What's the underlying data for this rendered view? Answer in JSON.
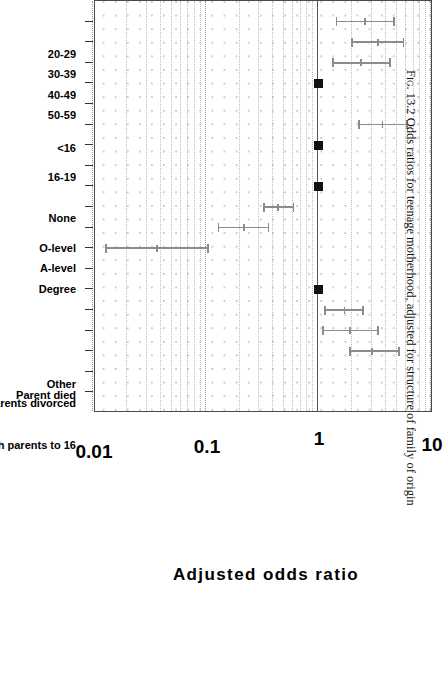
{
  "figure": {
    "caption_number": "Fig. 13.2",
    "caption_text": "Odds ratios for teenage motherhood, adjusted for structure of family of origin",
    "bleed_text": "scale adjusted for structure of family"
  },
  "axis": {
    "title": "Adjusted odds ratio",
    "ticks": [
      "0.01",
      "0.1",
      "1",
      "10"
    ],
    "min": 0.01,
    "max": 10
  },
  "groups": [
    {
      "name": "Age at interview",
      "label_lines": [
        "Age at",
        "interview"
      ]
    },
    {
      "name": "Age at first intercourse",
      "label_lines": [
        "Age at first",
        "intercourse"
      ]
    },
    {
      "name": "Education",
      "label_lines": [
        "Education"
      ]
    },
    {
      "name": "Family structure",
      "label_lines": [
        "Family",
        "structure"
      ]
    }
  ],
  "chart_data": {
    "type": "scatter",
    "title": "Odds ratios for teenage motherhood, adjusted for structure of family of origin",
    "xlabel": "",
    "ylabel": "Adjusted odds ratio",
    "orientation": "horizontal-forest-plot",
    "scale": "log10",
    "ylim": [
      0.01,
      10
    ],
    "grid": true,
    "reference_line": 1,
    "categories": [
      "20-29",
      "30-39",
      "40-49",
      "50-59",
      "<16",
      "16-19",
      "None",
      "O-level",
      "A-level",
      "Degree",
      "Lived with both parents to 16",
      "Parents divorced",
      "Parent died",
      "Other"
    ],
    "points": [
      {
        "category": "20-29",
        "group": "Age at interview",
        "odds_ratio": 2.6,
        "ci_low": 1.45,
        "ci_high": 4.7,
        "reference": false
      },
      {
        "category": "30-39",
        "group": "Age at interview",
        "odds_ratio": 3.4,
        "ci_low": 2.0,
        "ci_high": 5.7,
        "reference": false
      },
      {
        "category": "40-49",
        "group": "Age at interview",
        "odds_ratio": 2.4,
        "ci_low": 1.35,
        "ci_high": 4.3,
        "reference": false
      },
      {
        "category": "50-59",
        "group": "Age at interview",
        "odds_ratio": 1.0,
        "ci_low": 1.0,
        "ci_high": 1.0,
        "reference": true
      },
      {
        "category": "<16",
        "group": "Age at first intercourse",
        "odds_ratio": 3.7,
        "ci_low": 2.3,
        "ci_high": 6.1,
        "reference": false
      },
      {
        "category": "16-19",
        "group": "Age at first intercourse",
        "odds_ratio": 1.0,
        "ci_low": 1.0,
        "ci_high": 1.0,
        "reference": true
      },
      {
        "category": "None",
        "group": "Education",
        "odds_ratio": 1.0,
        "ci_low": 1.0,
        "ci_high": 1.0,
        "reference": true
      },
      {
        "category": "O-level",
        "group": "Education",
        "odds_ratio": 0.44,
        "ci_low": 0.33,
        "ci_high": 0.6,
        "reference": false
      },
      {
        "category": "A-level",
        "group": "Education",
        "odds_ratio": 0.22,
        "ci_low": 0.13,
        "ci_high": 0.36,
        "reference": false
      },
      {
        "category": "Degree",
        "group": "Education",
        "odds_ratio": 0.037,
        "ci_low": 0.013,
        "ci_high": 0.105,
        "reference": false
      },
      {
        "category": "Lived with both parents to 16",
        "group": "Family structure",
        "odds_ratio": 1.0,
        "ci_low": 1.0,
        "ci_high": 1.0,
        "reference": true
      },
      {
        "category": "Parents divorced",
        "group": "Family structure",
        "odds_ratio": 1.7,
        "ci_low": 1.15,
        "ci_high": 2.5,
        "reference": false
      },
      {
        "category": "Parent died",
        "group": "Family structure",
        "odds_ratio": 1.9,
        "ci_low": 1.1,
        "ci_high": 3.4,
        "reference": false
      },
      {
        "category": "Other",
        "group": "Family structure",
        "odds_ratio": 3.0,
        "ci_low": 1.9,
        "ci_high": 5.2,
        "reference": false
      }
    ]
  },
  "category_slots": {
    "20-29": 1,
    "30-39": 2,
    "40-49": 3,
    "50-59": 4,
    "<16": 6,
    "16-19": 7,
    "None": 9,
    "O-level": 10,
    "A-level": 11,
    "Degree": 12,
    "Lived with both parents to 16": 14,
    "Parents divorced": 15,
    "Parent died": 16,
    "Other": 17
  },
  "group_slots": {
    "Age at interview": 2.5,
    "Age at first intercourse": 6.5,
    "Education": 10.5,
    "Family structure": 15.5
  },
  "tick_count": 19
}
